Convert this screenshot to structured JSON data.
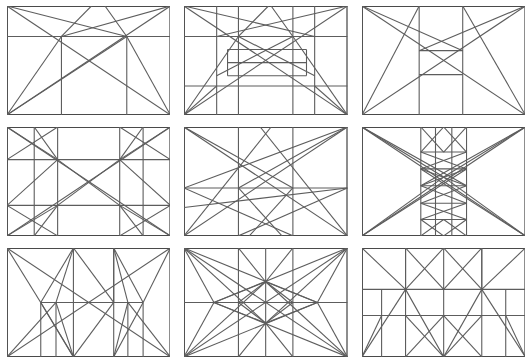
{
  "figure": {
    "rows": 3,
    "columns": 3,
    "background_color": "#ffffff",
    "line_color": "#5d5d5d",
    "frame_color": "#4a4a4a",
    "panel_count": 9
  },
  "panels": [
    {
      "id": "panel-1",
      "position": "row-1-col-1",
      "label": "Armature with upper band and thirds",
      "aspect": "3:2",
      "horizontal_divisions": [
        0.28
      ],
      "vertical_divisions": [
        0.333,
        0.735
      ],
      "diagonals": [
        "full-rectangle",
        "half-rectangle",
        "corner-fans"
      ]
    },
    {
      "id": "panel-2",
      "position": "row-1-col-2",
      "label": "Armature with nested central band",
      "aspect": "3:2",
      "horizontal_divisions": [
        0.28,
        0.4,
        0.64,
        0.735
      ],
      "vertical_divisions": [
        0.2,
        0.333,
        0.667,
        0.8
      ],
      "diagonals": [
        "full-rectangle",
        "half-rectangle",
        "corner-fans"
      ]
    },
    {
      "id": "panel-3",
      "position": "row-1-col-3",
      "label": "Armature with small central rectangle",
      "aspect": "3:2",
      "horizontal_divisions": [
        0.41,
        0.63
      ],
      "vertical_divisions": [
        0.35,
        0.62
      ],
      "diagonals": [
        "full-rectangle",
        "half-rectangle"
      ]
    },
    {
      "id": "panel-4",
      "position": "row-2-col-1",
      "label": "Symmetric four-point rabatment lattice",
      "aspect": "3:2",
      "horizontal_divisions": [
        0.3,
        0.72
      ],
      "vertical_divisions": [
        0.17,
        0.31,
        0.69,
        0.83
      ],
      "diagonals": [
        "full-rectangle",
        "quadrant-crosses",
        "corner-fans"
      ]
    },
    {
      "id": "panel-5",
      "position": "row-2-col-2",
      "label": "Asymmetric fan armature on thirds",
      "aspect": "3:2",
      "horizontal_divisions": [
        0.56
      ],
      "vertical_divisions": [
        0.333,
        0.667
      ],
      "diagonals": [
        "full-rectangle",
        "corner-fans",
        "cross-thirds"
      ]
    },
    {
      "id": "panel-6",
      "position": "row-2-col-3",
      "label": "Central column with nested sub-lattice",
      "aspect": "3:2",
      "horizontal_divisions": [
        0.23,
        0.385,
        0.54,
        0.7,
        0.85
      ],
      "vertical_divisions": [
        0.36,
        0.45,
        0.55,
        0.64
      ],
      "diagonals": [
        "full-rectangle",
        "corner-fans",
        "nested-crosses"
      ]
    },
    {
      "id": "panel-7",
      "position": "row-3-col-1",
      "label": "Zigzag armature with mid band",
      "aspect": "3:2",
      "horizontal_divisions": [
        0.5
      ],
      "vertical_divisions": [
        0.2,
        0.3,
        0.41,
        0.66,
        0.77,
        0.87
      ],
      "diagonals": [
        "full-rectangle",
        "zigzag",
        "corner-fans"
      ]
    },
    {
      "id": "panel-8",
      "position": "row-3-col-2",
      "label": "Radiating star armature",
      "aspect": "3:2",
      "horizontal_divisions": [
        0.5
      ],
      "vertical_divisions": [
        0.333,
        0.5,
        0.667
      ],
      "diagonals": [
        "full-rectangle",
        "star-fan",
        "inner-diamond"
      ]
    },
    {
      "id": "panel-9",
      "position": "row-3-col-3",
      "label": "Banded armature with triangular peaks",
      "aspect": "3:2",
      "horizontal_divisions": [
        0.38,
        0.62
      ],
      "vertical_divisions": [
        0.12,
        0.27,
        0.5,
        0.73,
        0.88
      ],
      "diagonals": [
        "full-rectangle",
        "peaks",
        "corner-fans"
      ]
    }
  ]
}
